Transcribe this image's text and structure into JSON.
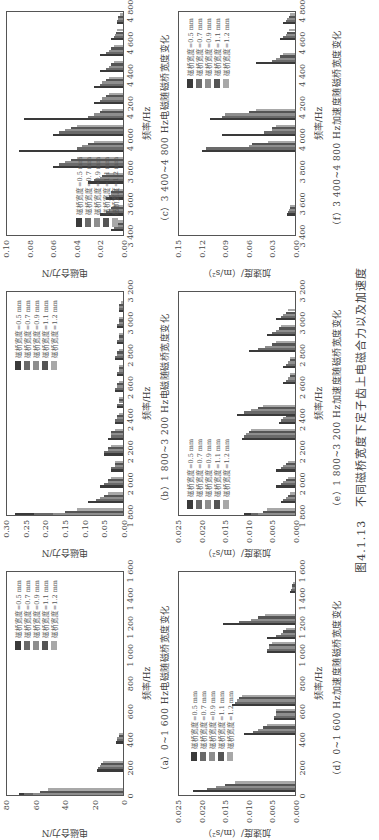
{
  "figure": {
    "number": "图4.1.13",
    "title": "不同磁桥宽度下定子齿上电磁合力以及加速度"
  },
  "legend": {
    "items": [
      {
        "label": "磁桥宽度=0.5 mm",
        "color": "#3a3a3a"
      },
      {
        "label": "磁桥宽度=0.7 mm",
        "color": "#6a6a6a"
      },
      {
        "label": "磁桥宽度=0.9 mm",
        "color": "#8e8e8e"
      },
      {
        "label": "磁桥宽度=1.1 mm",
        "color": "#555555"
      },
      {
        "label": "磁桥宽度=1.2 mm",
        "color": "#a8a8a8"
      }
    ]
  },
  "panels": [
    {
      "id": "a",
      "caption": "（a）0~1 600 Hz电磁随磁桥宽度变化",
      "xlabel": "频率/Hz",
      "ylabel": "电磁合力/N",
      "xticks": [
        "0",
        "200",
        "400",
        "600",
        "800",
        "1 000",
        "1 200",
        "1 400",
        "1 600"
      ],
      "yticks": [
        "0",
        "20",
        "40",
        "60",
        "80"
      ]
    },
    {
      "id": "b",
      "caption": "（b）1 800~3 200 Hz电磁随磁桥宽度变化",
      "xlabel": "频率/Hz",
      "ylabel": "电磁合力/N",
      "xticks": [
        "1 800",
        "2 000",
        "2 200",
        "2 400",
        "2 600",
        "2 800",
        "3 000",
        "3 200"
      ],
      "yticks": [
        "0.00",
        "0.05",
        "0.10",
        "0.15",
        "0.20",
        "0.25",
        "0.30"
      ]
    },
    {
      "id": "c",
      "caption": "（c）3 400~4 800 Hz电磁随磁桥宽度变化",
      "xlabel": "频率/Hz",
      "ylabel": "电磁合力/N",
      "xticks": [
        "3 400",
        "3 600",
        "3 800",
        "4 000",
        "4 200",
        "4 400",
        "4 600",
        "4 800"
      ],
      "yticks": [
        "0.00",
        "0.02",
        "0.04",
        "0.06",
        "0.08",
        "0.10"
      ]
    },
    {
      "id": "d",
      "caption": "（d）0~1 600 Hz加速度随磁桥宽度变化",
      "xlabel": "频率/Hz",
      "ylabel": "加速度/（m/s²）",
      "xticks": [
        "0",
        "200",
        "400",
        "600",
        "800",
        "1 000",
        "1 200",
        "1 400",
        "1 600"
      ],
      "yticks": [
        "0.000",
        "0.005",
        "0.010",
        "0.015",
        "0.020",
        "0.025"
      ]
    },
    {
      "id": "e",
      "caption": "（e）1 800~3 200 Hz加速度随磁桥宽度变化",
      "xlabel": "频率/Hz",
      "ylabel": "加速度/（m/s²）",
      "xticks": [
        "1 800",
        "2 000",
        "2 200",
        "2 400",
        "2 600",
        "2 800",
        "3 000",
        "3 200"
      ],
      "yticks": [
        "0.000",
        "0.005",
        "0.010",
        "0.015",
        "0.020",
        "0.025"
      ]
    },
    {
      "id": "f",
      "caption": "（f）3 400~4 800 Hz加速度随磁桥宽度变化",
      "xlabel": "频率/Hz",
      "ylabel": "加速度/（m/s²）",
      "xticks": [
        "3 400",
        "3 600",
        "3 800",
        "4 000",
        "4 200",
        "4 400",
        "4 600",
        "4 800"
      ],
      "yticks": [
        "0.00",
        "0.03",
        "0.06",
        "0.09",
        "0.12",
        "0.15"
      ]
    }
  ],
  "chart_data": [
    {
      "type": "bar",
      "title": "（a）0~1 600 Hz电磁随磁桥宽度变化",
      "xlabel": "频率/Hz",
      "ylabel": "电磁合力/N",
      "xlim": [
        0,
        1600
      ],
      "ylim": [
        0,
        80
      ],
      "x": [
        0,
        200,
        400
      ],
      "series": [
        {
          "name": "磁桥宽度=0.5 mm",
          "values": [
            72,
            18,
            5
          ]
        },
        {
          "name": "磁桥宽度=0.7 mm",
          "values": [
            68,
            17,
            4
          ]
        },
        {
          "name": "磁桥宽度=0.9 mm",
          "values": [
            62,
            16,
            4
          ]
        },
        {
          "name": "磁桥宽度=1.1 mm",
          "values": [
            57,
            15,
            3
          ]
        },
        {
          "name": "磁桥宽度=1.2 mm",
          "values": [
            52,
            14,
            3
          ]
        }
      ]
    },
    {
      "type": "bar",
      "title": "（b）1 800~3 200 Hz电磁随磁桥宽度变化",
      "xlabel": "频率/Hz",
      "ylabel": "电磁合力/N",
      "xlim": [
        1800,
        3200
      ],
      "ylim": [
        0,
        0.3
      ],
      "x": [
        1800,
        1900,
        2000,
        2100,
        2200,
        2300,
        2400,
        2500,
        2600,
        2700,
        2800,
        2900,
        3000,
        3100
      ],
      "series": [
        {
          "name": "磁桥宽度=0.5 mm",
          "values": [
            0.28,
            0.09,
            0.06,
            0.03,
            0.05,
            0.04,
            0.02,
            0.015,
            0.02,
            0.015,
            0.02,
            0.015,
            0.015,
            0.01
          ]
        },
        {
          "name": "磁桥宽度=0.7 mm",
          "values": [
            0.23,
            0.07,
            0.05,
            0.03,
            0.05,
            0.03,
            0.02,
            0.015,
            0.02,
            0.015,
            0.02,
            0.015,
            0.015,
            0.01
          ]
        },
        {
          "name": "磁桥宽度=0.9 mm",
          "values": [
            0.18,
            0.06,
            0.04,
            0.02,
            0.04,
            0.03,
            0.015,
            0.01,
            0.015,
            0.01,
            0.015,
            0.01,
            0.01,
            0.01
          ]
        },
        {
          "name": "磁桥宽度=1.1 mm",
          "values": [
            0.15,
            0.05,
            0.04,
            0.02,
            0.04,
            0.03,
            0.015,
            0.01,
            0.015,
            0.01,
            0.015,
            0.01,
            0.01,
            0.01
          ]
        },
        {
          "name": "磁桥宽度=1.2 mm",
          "values": [
            0.12,
            0.04,
            0.03,
            0.02,
            0.03,
            0.02,
            0.01,
            0.01,
            0.01,
            0.01,
            0.01,
            0.01,
            0.01,
            0.005
          ]
        }
      ]
    },
    {
      "type": "bar",
      "title": "（c）3 400~4 800 Hz电磁随磁桥宽度变化",
      "xlabel": "频率/Hz",
      "ylabel": "电磁合力/N",
      "xlim": [
        3400,
        4800
      ],
      "ylim": [
        0,
        0.1
      ],
      "x": [
        3450,
        3550,
        3650,
        3750,
        3850,
        3950,
        4050,
        4150,
        4250,
        4350,
        4450,
        4550,
        4650,
        4750
      ],
      "series": [
        {
          "name": "磁桥宽度=0.5 mm",
          "values": [
            0.01,
            0.02,
            0.015,
            0.03,
            0.06,
            0.09,
            0.06,
            0.085,
            0.025,
            0.025,
            0.02,
            0.02,
            0.01,
            0.005
          ]
        },
        {
          "name": "磁桥宽度=0.7 mm",
          "values": [
            0.008,
            0.015,
            0.012,
            0.025,
            0.055,
            0.04,
            0.055,
            0.03,
            0.02,
            0.02,
            0.015,
            0.015,
            0.008,
            0.005
          ]
        },
        {
          "name": "磁桥宽度=0.9 mm",
          "values": [
            0.007,
            0.012,
            0.01,
            0.02,
            0.05,
            0.035,
            0.05,
            0.025,
            0.018,
            0.018,
            0.012,
            0.012,
            0.007,
            0.004
          ]
        },
        {
          "name": "磁桥宽度=1.1 mm",
          "values": [
            0.006,
            0.01,
            0.01,
            0.018,
            0.045,
            0.03,
            0.045,
            0.02,
            0.015,
            0.015,
            0.01,
            0.01,
            0.006,
            0.004
          ]
        },
        {
          "name": "磁桥宽度=1.2 mm",
          "values": [
            0.005,
            0.008,
            0.008,
            0.015,
            0.04,
            0.025,
            0.04,
            0.018,
            0.012,
            0.012,
            0.008,
            0.008,
            0.005,
            0.003
          ]
        }
      ]
    },
    {
      "type": "bar",
      "title": "（d）0~1 600 Hz加速度随磁桥宽度变化",
      "xlabel": "频率/Hz",
      "ylabel": "加速度/（m/s²）",
      "xlim": [
        0,
        1600
      ],
      "ylim": [
        0,
        0.025
      ],
      "x": [
        50,
        460,
        570,
        670,
        1050,
        1150,
        1250,
        1480
      ],
      "series": [
        {
          "name": "磁桥宽度=0.5 mm",
          "values": [
            0.022,
            0.011,
            0.0045,
            0.0135,
            0.006,
            0.006,
            0.0155,
            0.001
          ]
        },
        {
          "name": "磁桥宽度=0.7 mm",
          "values": [
            0.019,
            0.009,
            0.0045,
            0.013,
            0.006,
            0.004,
            0.012,
            0.0008
          ]
        },
        {
          "name": "磁桥宽度=0.9 mm",
          "values": [
            0.017,
            0.008,
            0.004,
            0.0125,
            0.0055,
            0.003,
            0.0095,
            0.0007
          ]
        },
        {
          "name": "磁桥宽度=1.1 mm",
          "values": [
            0.015,
            0.007,
            0.004,
            0.012,
            0.0055,
            0.0025,
            0.008,
            0.0006
          ]
        },
        {
          "name": "磁桥宽度=1.2 mm",
          "values": [
            0.013,
            0.006,
            0.004,
            0.0115,
            0.005,
            0.002,
            0.0065,
            0.0005
          ]
        }
      ]
    },
    {
      "type": "bar",
      "title": "（e）1 800~3 200 Hz加速度随磁桥宽度变化",
      "xlabel": "频率/Hz",
      "ylabel": "加速度/（m/s²）",
      "xlim": [
        1800,
        3200
      ],
      "ylim": [
        0,
        0.025
      ],
      "x": [
        1800,
        1900,
        2000,
        2100,
        2300,
        2400,
        2450,
        2650,
        2750,
        2850,
        2950,
        3050
      ],
      "series": [
        {
          "name": "磁桥宽度=0.5 mm",
          "values": [
            0.011,
            0.003,
            0.004,
            0.004,
            0.0115,
            0.0035,
            0.0125,
            0.0025,
            0.0025,
            0.01,
            0.006,
            0.004
          ]
        },
        {
          "name": "磁桥宽度=0.7 mm",
          "values": [
            0.0095,
            0.0025,
            0.003,
            0.003,
            0.011,
            0.003,
            0.011,
            0.002,
            0.002,
            0.008,
            0.005,
            0.003
          ]
        },
        {
          "name": "磁桥宽度=0.9 mm",
          "values": [
            0.008,
            0.002,
            0.0025,
            0.0025,
            0.0105,
            0.0025,
            0.0095,
            0.0015,
            0.0015,
            0.0065,
            0.004,
            0.0025
          ]
        },
        {
          "name": "磁桥宽度=1.1 mm",
          "values": [
            0.007,
            0.0015,
            0.002,
            0.002,
            0.01,
            0.002,
            0.008,
            0.001,
            0.001,
            0.005,
            0.0035,
            0.002
          ]
        },
        {
          "name": "磁桥宽度=1.2 mm",
          "values": [
            0.006,
            0.001,
            0.0015,
            0.0015,
            0.0095,
            0.0015,
            0.007,
            0.001,
            0.001,
            0.004,
            0.003,
            0.0015
          ]
        }
      ]
    },
    {
      "type": "bar",
      "title": "（f）3 400~4 800 Hz加速度随磁桥宽度变化",
      "xlabel": "频率/Hz",
      "ylabel": "加速度/（m/s²）",
      "xlim": [
        3400,
        4800
      ],
      "ylim": [
        0,
        0.15
      ],
      "x": [
        3550,
        3950,
        4050,
        4150,
        4500,
        4650,
        4750
      ],
      "series": [
        {
          "name": "磁桥宽度=0.5 mm",
          "values": [
            0.01,
            0.12,
            0.095,
            0.11,
            0.05,
            0.02,
            0.015
          ]
        },
        {
          "name": "磁桥宽度=0.7 mm",
          "values": [
            0.009,
            0.115,
            0.04,
            0.095,
            0.03,
            0.015,
            0.012
          ]
        },
        {
          "name": "磁桥宽度=0.9 mm",
          "values": [
            0.008,
            0.06,
            0.03,
            0.09,
            0.025,
            0.012,
            0.01
          ]
        },
        {
          "name": "磁桥宽度=1.1 mm",
          "values": [
            0.007,
            0.055,
            0.03,
            0.06,
            0.02,
            0.01,
            0.008
          ]
        },
        {
          "name": "磁桥宽度=1.2 mm",
          "values": [
            0.006,
            0.035,
            0.025,
            0.05,
            0.015,
            0.008,
            0.006
          ]
        }
      ]
    }
  ]
}
